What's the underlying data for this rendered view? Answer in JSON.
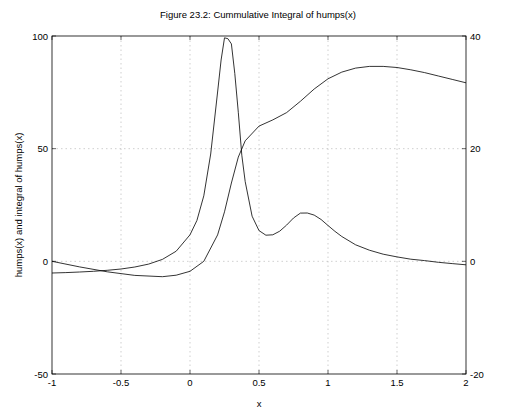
{
  "chart_data": {
    "type": "line",
    "title": "Figure 23.2: Cummulative Integral of humps(x)",
    "xlabel": "x",
    "ylabel": "humps(x) and integral of humps(x)",
    "xlim": [
      -1,
      2
    ],
    "ylim": [
      -50,
      100
    ],
    "y2lim": [
      -20,
      40
    ],
    "grid": true,
    "legend": "none",
    "xticks": [
      -1,
      -0.5,
      0,
      0.5,
      1,
      1.5,
      2
    ],
    "xtick_labels": [
      "-1",
      "-0.5",
      "0",
      "0.5",
      "1",
      "1.5",
      "2"
    ],
    "yticks": [
      -50,
      0,
      50,
      100
    ],
    "ytick_labels": [
      "-50",
      "0",
      "50",
      "100"
    ],
    "y2ticks": [
      -20,
      0,
      20,
      40
    ],
    "y2tick_labels": [
      "-20",
      "0",
      "20",
      "40"
    ],
    "line_color": "#000000",
    "grid_color": "#b0b0b0",
    "series": [
      {
        "name": "humps(x)",
        "axis": "left",
        "x": [
          -1,
          -0.9,
          -0.8,
          -0.7,
          -0.6,
          -0.5,
          -0.4,
          -0.3,
          -0.2,
          -0.1,
          0,
          0.05,
          0.1,
          0.15,
          0.2,
          0.225,
          0.25,
          0.275,
          0.3,
          0.325,
          0.35,
          0.375,
          0.4,
          0.45,
          0.5,
          0.55,
          0.6,
          0.65,
          0.7,
          0.75,
          0.8,
          0.85,
          0.9,
          0.95,
          1.0,
          1.05,
          1.1,
          1.2,
          1.3,
          1.4,
          1.5,
          1.6,
          1.7,
          1.8,
          1.9,
          2
        ],
        "y": [
          -5.18,
          -4.99,
          -4.75,
          -4.42,
          -3.99,
          -3.39,
          -2.53,
          -1.24,
          0.85,
          4.51,
          11.77,
          18.11,
          29.08,
          47.63,
          75.13,
          89.36,
          99.18,
          98.82,
          96.5,
          83.32,
          66.15,
          47.09,
          35.39,
          20.02,
          13.62,
          11.58,
          11.79,
          13.38,
          16.09,
          19.25,
          21.4,
          21.43,
          20.52,
          18.56,
          15.92,
          13.35,
          11.03,
          7.33,
          4.94,
          3.17,
          1.97,
          0.96,
          0.31,
          -0.42,
          -0.99,
          -1.53
        ]
      },
      {
        "name": "integral of humps(x)",
        "axis": "right",
        "x": [
          -1,
          -0.8,
          -0.6,
          -0.4,
          -0.2,
          -0.1,
          0,
          0.1,
          0.2,
          0.25,
          0.3,
          0.35,
          0.4,
          0.5,
          0.6,
          0.7,
          0.8,
          0.9,
          1.0,
          1.1,
          1.2,
          1.3,
          1.4,
          1.5,
          1.6,
          1.7,
          1.8,
          1.9,
          2
        ],
        "y": [
          0,
          -0.98,
          -1.85,
          -2.5,
          -2.72,
          -2.47,
          -1.77,
          0.0,
          4.7,
          8.8,
          13.9,
          18.5,
          21.4,
          24.0,
          25.1,
          26.4,
          28.4,
          30.6,
          32.4,
          33.6,
          34.3,
          34.6,
          34.6,
          34.4,
          34.0,
          33.5,
          32.9,
          32.3,
          31.7
        ]
      }
    ]
  }
}
